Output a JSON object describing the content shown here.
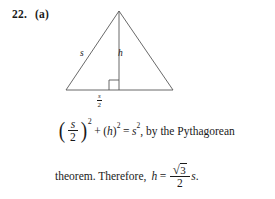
{
  "problem": {
    "number": "22.",
    "part": "(a)"
  },
  "figure": {
    "name": "equilateral-triangle-with-altitude",
    "side_label": "s",
    "height_label": "h",
    "base_label_numerator": "s",
    "base_label_denominator": "2",
    "right_angle_marker": true,
    "stroke_color": "#4a4a4a",
    "apex": {
      "x": 64,
      "y": 7
    },
    "left_vertex": {
      "x": 11,
      "y": 86
    },
    "right_vertex": {
      "x": 118,
      "y": 86
    },
    "foot": {
      "x": 64,
      "y": 86
    }
  },
  "equation_line_1": {
    "open_paren": "(",
    "frac_numerator": "s",
    "frac_denominator": "2",
    "close_paren": ")",
    "paren_exponent": "2",
    "plus": "+",
    "h_open_paren": "(",
    "h_var": "h",
    "h_close_paren": ")",
    "h_exponent": "2",
    "equals": "=",
    "rhs_var": "s",
    "rhs_exponent": "2",
    "comma": ",",
    "trailing_text": "by the Pythagorean"
  },
  "equation_line_2": {
    "leading_text": "theorem. Therefore,",
    "h_var": "h",
    "equals": "=",
    "radical_sign": "√",
    "radicand": "3",
    "denominator": "2",
    "multiplier_var": "s",
    "period": "."
  }
}
